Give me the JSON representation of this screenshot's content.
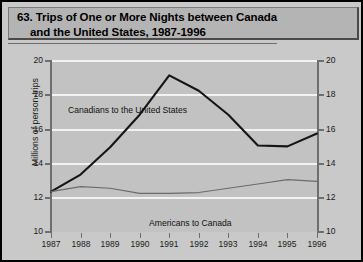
{
  "figure": {
    "number_label": "63.",
    "title_line1": "63. Trips of One or More Nights between Canada",
    "title_line2": "and the United States, 1987-1996"
  },
  "chart_data": {
    "type": "line",
    "title": "63. Trips of One or More Nights between Canada and the United States, 1987-1996",
    "xlabel": "",
    "ylabel": "Millions of person-trips",
    "x": [
      1987,
      1988,
      1989,
      1990,
      1991,
      1992,
      1993,
      1994,
      1995,
      1996
    ],
    "xtick_labels": [
      "1987",
      "1988",
      "1989",
      "1990",
      "1991",
      "1992",
      "1993",
      "1994",
      "1995",
      "1996"
    ],
    "ytick_labels": [
      "10",
      "12",
      "14",
      "16",
      "18",
      "20"
    ],
    "yticks": [
      10,
      12,
      14,
      16,
      18,
      20
    ],
    "ylim": [
      10,
      20
    ],
    "xlim": [
      1987,
      1996
    ],
    "grid": true,
    "grid_axis": "y",
    "legend_position": "inline-annotations",
    "dual_y_axis": true,
    "right_ytick_labels": [
      "10",
      "12",
      "14",
      "16",
      "18",
      "20"
    ],
    "series": [
      {
        "name": "Canadians to the United States",
        "values": [
          12.3,
          13.3,
          14.9,
          16.8,
          19.1,
          18.2,
          16.8,
          15.0,
          14.95,
          15.7
        ],
        "color": "#151515",
        "line_width": 2.1
      },
      {
        "name": "Americans to Canada",
        "values": [
          12.3,
          12.6,
          12.5,
          12.2,
          12.2,
          12.25,
          12.5,
          12.75,
          13.0,
          12.9
        ],
        "color": "#6b6b6b",
        "line_width": 1.2
      }
    ],
    "annotations": [
      {
        "text": "Canadians to the United States",
        "x": 1987.6,
        "y": 19.6
      },
      {
        "text": "Americans to Canada",
        "x": 1990.9,
        "y": 13.0
      }
    ]
  },
  "colors": {
    "page_background": "#c9c9c9",
    "title_band": "#b4b4b4",
    "plot_background": "#c2c2c2",
    "gridline": "#f2f2f2",
    "axis": "#6e6e6e",
    "border": "#000000"
  }
}
